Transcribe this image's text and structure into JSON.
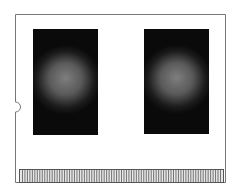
{
  "diagram": {
    "components": [
      {
        "id": "chip-left",
        "kind": "memory-chip"
      },
      {
        "id": "chip-right",
        "kind": "memory-chip"
      },
      {
        "id": "edge-connector",
        "kind": "pin-connector",
        "pin_count": 82
      },
      {
        "id": "side-notch",
        "kind": "notch",
        "side": "left"
      }
    ]
  },
  "colors": {
    "board_fill": "#ffffff",
    "board_outline": "#777777",
    "chip_edge": "#0a0a0a",
    "chip_center": "#7e7e7e",
    "pin_stroke": "#555555",
    "pin_fill": "#e8e8e8"
  }
}
